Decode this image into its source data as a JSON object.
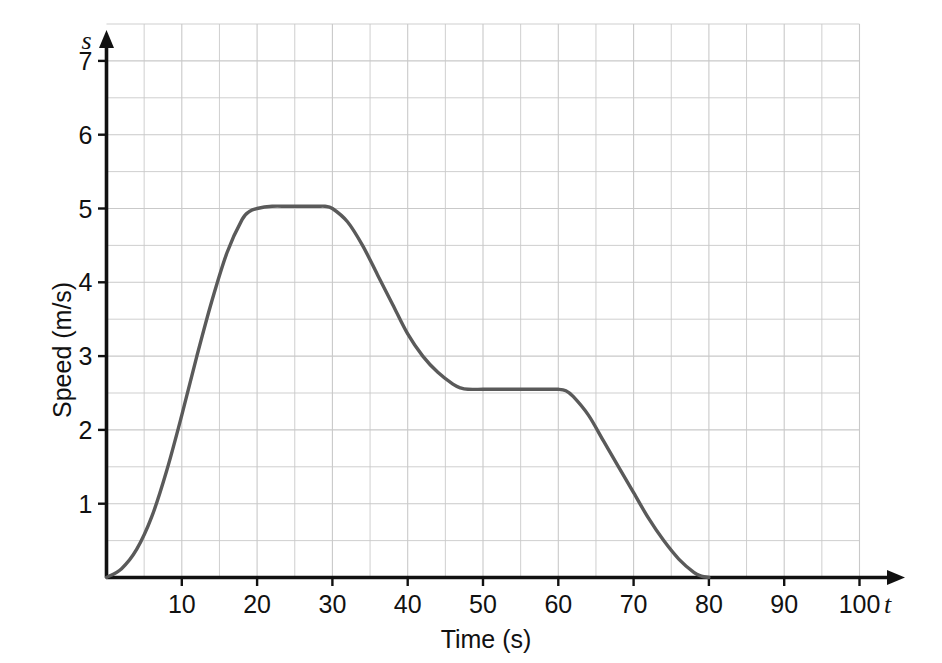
{
  "chart_data": {
    "type": "line",
    "title": "",
    "xlabel": "Time (s)",
    "ylabel": "Speed (m/s)",
    "x_axis_symbol": "t",
    "y_axis_symbol": "s",
    "xlim": [
      0,
      100
    ],
    "ylim": [
      0,
      7.5
    ],
    "x_ticks": [
      10,
      20,
      30,
      40,
      50,
      60,
      70,
      80,
      90,
      100
    ],
    "x_tick_labels": [
      "10",
      "20",
      "30",
      "40",
      "50",
      "60",
      "70",
      "80",
      "90",
      "100"
    ],
    "y_ticks": [
      1,
      2,
      3,
      4,
      5,
      6,
      7
    ],
    "y_tick_labels": [
      "1",
      "2",
      "3",
      "4",
      "5",
      "6",
      "7"
    ],
    "x_minor_step": 5,
    "y_minor_step": 0.5,
    "grid": true,
    "grid_color": "#c9c9c9",
    "axis_color": "#111111",
    "line_color": "#5a5a5a",
    "line_width": 3.4,
    "legend": "none",
    "series": [
      {
        "name": "speed",
        "x": [
          0,
          2,
          4,
          6,
          8,
          10,
          12,
          14,
          16,
          18,
          19,
          20,
          22,
          24,
          26,
          28,
          29,
          30,
          32,
          34,
          36,
          38,
          40,
          42,
          44,
          46,
          47,
          48,
          50,
          52,
          54,
          56,
          58,
          60,
          61,
          62,
          64,
          66,
          68,
          70,
          72,
          74,
          76,
          78,
          79,
          80
        ],
        "y": [
          0,
          0.12,
          0.38,
          0.82,
          1.45,
          2.2,
          3.0,
          3.75,
          4.4,
          4.85,
          4.96,
          5.0,
          5.03,
          5.03,
          5.03,
          5.03,
          5.03,
          5.0,
          4.82,
          4.5,
          4.1,
          3.7,
          3.3,
          3.0,
          2.78,
          2.62,
          2.57,
          2.55,
          2.55,
          2.55,
          2.55,
          2.55,
          2.55,
          2.55,
          2.53,
          2.45,
          2.2,
          1.85,
          1.5,
          1.15,
          0.8,
          0.5,
          0.25,
          0.07,
          0.02,
          0
        ]
      }
    ],
    "annotations": {
      "plateau_1_value": 5,
      "plateau_1_range": [
        19,
        29
      ],
      "plateau_2_value": 2.5,
      "plateau_2_range": [
        48,
        60
      ],
      "start_point": [
        0,
        0
      ],
      "end_point": [
        80,
        0
      ]
    }
  }
}
